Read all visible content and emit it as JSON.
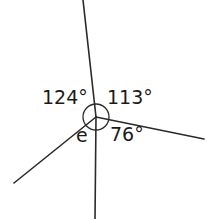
{
  "diagram": {
    "type": "angles-around-a-point",
    "center": {
      "x": 96,
      "y": 117
    },
    "arc_radius": 13,
    "line_color": "#2a2a2a",
    "rays": [
      {
        "name": "up",
        "end": {
          "x": 83,
          "y": 0
        }
      },
      {
        "name": "right",
        "end": {
          "x": 204,
          "y": 139
        }
      },
      {
        "name": "down",
        "end": {
          "x": 95,
          "y": 219
        }
      },
      {
        "name": "lower-left",
        "end": {
          "x": 14,
          "y": 183
        }
      }
    ],
    "labels": {
      "upper_left": "124°",
      "upper_right": "113°",
      "lower_right": "76°",
      "lower_left": "e"
    }
  }
}
